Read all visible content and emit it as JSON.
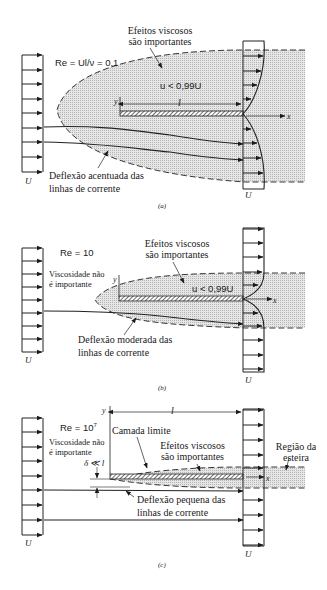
{
  "panels": [
    {
      "id": "a",
      "caption": "(a)",
      "reynolds": "Re = Ul/ν = 0,1",
      "viscous_label_line1": "Efeitos viscosos",
      "viscous_label_line2": "são importantes",
      "velocity_condition": "u < 0,99U",
      "plate_length": "l",
      "y_axis": "y",
      "x_axis": "x",
      "deflection_line1": "Deflexão acentuada das",
      "deflection_line2": "linhas de corrente",
      "upstream_velocity": "U",
      "downstream_velocity": "U"
    },
    {
      "id": "b",
      "caption": "(b)",
      "reynolds": "Re = 10",
      "inviscid_line1": "Viscosidade não",
      "inviscid_line2": "é importante",
      "viscous_label_line1": "Efeitos viscosos",
      "viscous_label_line2": "são importantes",
      "velocity_condition": "u < 0,99U",
      "y_axis": "y",
      "x_axis": "x",
      "deflection_line1": "Deflexão moderada das",
      "deflection_line2": "linhas de corrente",
      "upstream_velocity": "U",
      "downstream_velocity": "U"
    },
    {
      "id": "c",
      "caption": "(c)",
      "reynolds_base": "Re = 10",
      "reynolds_exp": "7",
      "inviscid_line1": "Viscosidade não",
      "inviscid_line2": "é importante",
      "boundary_layer": "Camada limite",
      "viscous_label_line1": "Efeitos viscosos",
      "viscous_label_line2": "são importantes",
      "thickness": "δ ≪ l",
      "plate_length": "l",
      "y_axis": "y",
      "x_axis": "x",
      "wake_line1": "Região da",
      "wake_line2": "esteira",
      "deflection_line1": "Deflexão pequena das",
      "deflection_line2": "linhas de corrente",
      "upstream_velocity": "U",
      "downstream_velocity": "U"
    }
  ],
  "colors": {
    "ink": "#1a1a1a",
    "viscous_region": "#cfcfcf",
    "background": "#ffffff"
  }
}
